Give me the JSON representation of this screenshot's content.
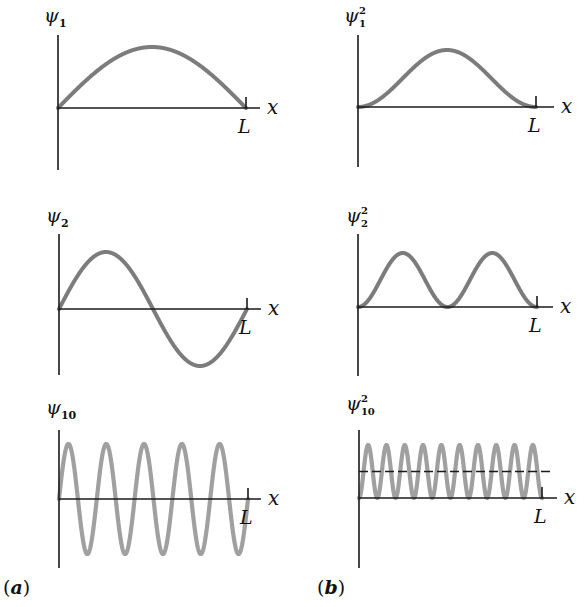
{
  "figure": {
    "column_labels": {
      "a": {
        "open": "(",
        "letter": "a",
        "close": ")"
      },
      "b": {
        "open": "(",
        "letter": "b",
        "close": ")"
      }
    },
    "x_axis_label": "x",
    "end_label": "L",
    "colors": {
      "axis": "#1a1a1a",
      "curve_dark": "#7c7c7c",
      "curve_light": "#a0a0a0",
      "dashed_line": "#1a1a1a"
    }
  },
  "chart_data": [
    {
      "id": "psi1",
      "type": "line",
      "column": "a",
      "title_symbol": "ψ",
      "title_subscript": "1",
      "title_superscript": "",
      "function": "sin(n*pi*x/L)",
      "n": 1,
      "xlabel": "x",
      "x_end_label": "L",
      "xlim": [
        0,
        1
      ],
      "ylim": [
        -1,
        1
      ],
      "x": [
        0,
        0.25,
        0.5,
        0.75,
        1.0
      ],
      "y": [
        0,
        0.707,
        1,
        0.707,
        0
      ]
    },
    {
      "id": "psi1sq",
      "type": "line",
      "column": "b",
      "title_symbol": "ψ",
      "title_subscript": "1",
      "title_superscript": "2",
      "function": "sin^2(n*pi*x/L)",
      "n": 1,
      "xlabel": "x",
      "x_end_label": "L",
      "xlim": [
        0,
        1
      ],
      "ylim": [
        0,
        1
      ],
      "x": [
        0,
        0.25,
        0.5,
        0.75,
        1.0
      ],
      "y": [
        0,
        0.5,
        1,
        0.5,
        0
      ]
    },
    {
      "id": "psi2",
      "type": "line",
      "column": "a",
      "title_symbol": "ψ",
      "title_subscript": "2",
      "title_superscript": "",
      "function": "sin(n*pi*x/L)",
      "n": 2,
      "xlabel": "x",
      "x_end_label": "L",
      "xlim": [
        0,
        1
      ],
      "ylim": [
        -1,
        1
      ],
      "x": [
        0,
        0.25,
        0.5,
        0.75,
        1.0
      ],
      "y": [
        0,
        1,
        0,
        -1,
        0
      ]
    },
    {
      "id": "psi2sq",
      "type": "line",
      "column": "b",
      "title_symbol": "ψ",
      "title_subscript": "2",
      "title_superscript": "2",
      "function": "sin^2(n*pi*x/L)",
      "n": 2,
      "xlabel": "x",
      "x_end_label": "L",
      "xlim": [
        0,
        1
      ],
      "ylim": [
        0,
        1
      ],
      "x": [
        0,
        0.25,
        0.5,
        0.75,
        1.0
      ],
      "y": [
        0,
        1,
        0,
        1,
        0
      ]
    },
    {
      "id": "psi10",
      "type": "line",
      "column": "a",
      "title_symbol": "ψ",
      "title_subscript": "10",
      "title_superscript": "",
      "function": "sin(n*pi*x/L)",
      "n": 10,
      "xlabel": "x",
      "x_end_label": "L",
      "xlim": [
        0,
        1
      ],
      "ylim": [
        -1,
        1
      ],
      "peaks": 5,
      "troughs": 5
    },
    {
      "id": "psi10sq",
      "type": "line",
      "column": "b",
      "title_symbol": "ψ",
      "title_subscript": "10",
      "title_superscript": "2",
      "function": "sin^2(n*pi*x/L)",
      "n": 10,
      "xlabel": "x",
      "x_end_label": "L",
      "xlim": [
        0,
        1
      ],
      "ylim": [
        0,
        1
      ],
      "peaks": 10,
      "dashed_average": 0.5
    }
  ]
}
